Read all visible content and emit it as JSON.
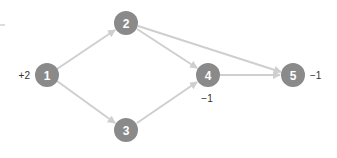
{
  "diagram": {
    "type": "directed-network-flow",
    "colors": {
      "node": "#8a8a8a",
      "edge": "#cfcfcf",
      "node_text": "#ffffff",
      "label_text": "#333333"
    },
    "nodes": [
      {
        "id": "1",
        "label": "1",
        "x": 47,
        "y": 75,
        "supply": "+2",
        "supply_pos": "left"
      },
      {
        "id": "2",
        "label": "2",
        "x": 126,
        "y": 23,
        "supply": "",
        "supply_pos": ""
      },
      {
        "id": "3",
        "label": "3",
        "x": 126,
        "y": 130,
        "supply": "",
        "supply_pos": ""
      },
      {
        "id": "4",
        "label": "4",
        "x": 208,
        "y": 75,
        "supply": "−1",
        "supply_pos": "below"
      },
      {
        "id": "5",
        "label": "5",
        "x": 293,
        "y": 75,
        "supply": "−1",
        "supply_pos": "right"
      }
    ],
    "edges": [
      {
        "from": "1",
        "to": "2"
      },
      {
        "from": "1",
        "to": "3"
      },
      {
        "from": "2",
        "to": "4"
      },
      {
        "from": "2",
        "to": "5"
      },
      {
        "from": "3",
        "to": "4"
      },
      {
        "from": "4",
        "to": "5"
      }
    ]
  }
}
